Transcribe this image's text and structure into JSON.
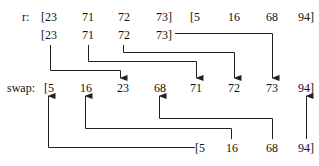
{
  "labels": {
    "r": "r:",
    "swap": "swap:"
  },
  "rows": {
    "r_top": [
      "[23",
      "71",
      "72",
      "73]",
      "[5",
      "16",
      "68",
      "94]"
    ],
    "r_left": [
      "[23",
      "71",
      "72",
      "73]"
    ],
    "swap": [
      "[5",
      "16",
      "23",
      "68",
      "71",
      "72",
      "73",
      "94]"
    ],
    "r_right": [
      "[5",
      "16",
      "68",
      "94]"
    ]
  },
  "colors": {
    "line": "#222222",
    "text": "#111111"
  }
}
